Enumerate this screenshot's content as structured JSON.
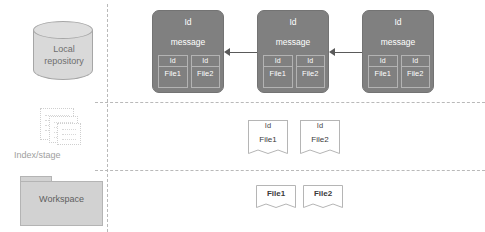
{
  "diagram": {
    "colors": {
      "commit_fill": "#808080",
      "cylinder_fill": "#d9d9d9",
      "folder_fill": "#d2d2d2",
      "separator": "#b9b9b9",
      "arrow": "#5a5a5a"
    },
    "zones": [
      {
        "key": "local_repository",
        "label": "Local\nrepository"
      },
      {
        "key": "index_stage",
        "label": "Index/stage"
      },
      {
        "key": "workspace",
        "label": "Workspace"
      }
    ],
    "local_repository": {
      "label_line1": "Local",
      "label_line2": "repository"
    },
    "index_stage": {
      "label": "Index/stage"
    },
    "workspace": {
      "label": "Workspace"
    },
    "commits": [
      {
        "id_label": "Id",
        "message_label": "message",
        "files": [
          {
            "id_label": "Id",
            "name": "File1"
          },
          {
            "id_label": "Id",
            "name": "File2"
          }
        ]
      },
      {
        "id_label": "Id",
        "message_label": "message",
        "files": [
          {
            "id_label": "Id",
            "name": "File1"
          },
          {
            "id_label": "Id",
            "name": "File2"
          }
        ]
      },
      {
        "id_label": "Id",
        "message_label": "message",
        "files": [
          {
            "id_label": "Id",
            "name": "File1"
          },
          {
            "id_label": "Id",
            "name": "File2"
          }
        ]
      }
    ],
    "staged_files": [
      {
        "id_label": "Id",
        "name": "File1"
      },
      {
        "id_label": "Id",
        "name": "File2"
      }
    ],
    "workspace_files": [
      {
        "name": "File1"
      },
      {
        "name": "File2"
      }
    ]
  }
}
